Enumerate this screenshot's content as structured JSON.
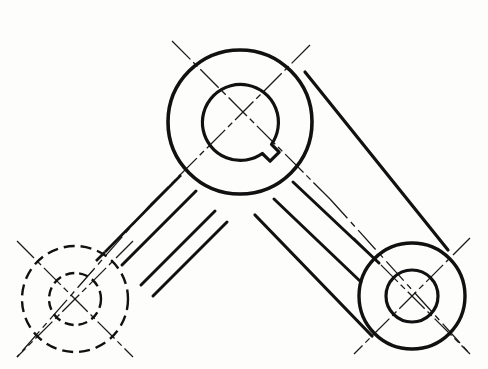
{
  "drawing": {
    "title": "Mechanical Bell Crank / Three-Lobe Link Plate",
    "type": "orthographic-engineering-drawing",
    "view": "front-elevation",
    "canvas": {
      "width": 488,
      "height": 369,
      "background": "#fdfdfc"
    },
    "style": {
      "object_line_color": "#111111",
      "object_line_width": 3.2,
      "hidden_line_color": "#111111",
      "hidden_line_width": 2.0,
      "hidden_dash_pattern": "9 5",
      "center_line_color": "#1a1a1a",
      "center_line_width": 1.3,
      "center_dash_pattern": "22 5 5 5"
    },
    "bosses": [
      {
        "name": "top-boss",
        "label": "Upper hub with keyway",
        "center_x": 240,
        "center_y": 122,
        "outer_radius": 72,
        "inner_radius": 38,
        "visibility": "visible",
        "has_keyway": true,
        "keyway_angle_deg": 45,
        "keyway_width": 13,
        "keyway_depth": 11
      },
      {
        "name": "left-boss",
        "label": "Left hub (hidden)",
        "center_x": 75,
        "center_y": 299,
        "outer_radius": 53,
        "inner_radius": 26,
        "visibility": "hidden",
        "has_keyway": false
      },
      {
        "name": "right-boss",
        "label": "Right hub",
        "center_x": 412,
        "center_y": 296,
        "outer_radius": 53,
        "inner_radius": 26,
        "visibility": "visible",
        "has_keyway": false
      }
    ],
    "arms": [
      {
        "name": "left-arm",
        "label": "Left connecting arm",
        "from": "top-boss",
        "to": "left-boss",
        "visibility": "mixed",
        "rib_lines": 2
      },
      {
        "name": "right-arm",
        "label": "Right connecting arm",
        "from": "top-boss",
        "to": "right-boss",
        "visibility": "visible",
        "rib_lines": 2
      }
    ],
    "center_lines": [
      {
        "name": "top-boss-centerline-a",
        "angle_deg": 45
      },
      {
        "name": "top-boss-centerline-b",
        "angle_deg": -45
      },
      {
        "name": "left-boss-centerline-a",
        "angle_deg": 45
      },
      {
        "name": "left-boss-centerline-b",
        "angle_deg": -45
      },
      {
        "name": "right-boss-centerline-a",
        "angle_deg": 45
      },
      {
        "name": "right-boss-centerline-b",
        "angle_deg": -45
      },
      {
        "name": "left-arm-axis-centerline",
        "angle_deg": 45
      },
      {
        "name": "right-arm-axis-centerline",
        "angle_deg": -45
      }
    ],
    "annotations": [],
    "dimensions": []
  }
}
